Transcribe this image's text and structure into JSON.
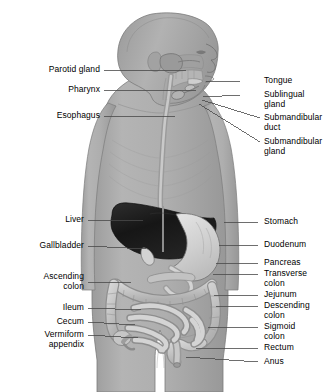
{
  "figure": {
    "background_color": "#ffffff",
    "body_fill": "#a9a9a9",
    "body_outline": "#6f6f6f",
    "text_color": "#000000",
    "leader_color": "#4a4a4a"
  },
  "labels_left": [
    {
      "name": "parotid-gland",
      "text": "Parotid gland",
      "x": 22,
      "y": 65,
      "w": 78,
      "lx1": 104,
      "ly1": 70,
      "lx2": 186,
      "ly2": 70
    },
    {
      "name": "pharynx",
      "text": "Pharynx",
      "x": 42,
      "y": 85,
      "w": 58,
      "lx1": 104,
      "ly1": 90,
      "lx2": 196,
      "ly2": 90
    },
    {
      "name": "esophagus",
      "text": "Esophagus",
      "x": 30,
      "y": 111,
      "w": 70,
      "lx1": 104,
      "ly1": 116,
      "lx2": 175,
      "ly2": 116
    },
    {
      "name": "liver",
      "text": "Liver",
      "x": 44,
      "y": 215,
      "w": 40,
      "lx1": 88,
      "ly1": 220,
      "lx2": 143,
      "ly2": 220
    },
    {
      "name": "gallbladder",
      "text": "Gallbladder",
      "x": 12,
      "y": 241,
      "w": 72,
      "lx1": 88,
      "ly1": 246,
      "lx2": 146,
      "ly2": 249
    },
    {
      "name": "ascending-colon",
      "text": "Ascending\ncolon",
      "x": 18,
      "y": 272,
      "w": 66,
      "lx1": 88,
      "ly1": 282,
      "lx2": 131,
      "ly2": 282
    },
    {
      "name": "ileum",
      "text": "Ileum",
      "x": 42,
      "y": 303,
      "w": 42,
      "lx1": 88,
      "ly1": 308,
      "lx2": 141,
      "ly2": 310
    },
    {
      "name": "cecum",
      "text": "Cecum",
      "x": 38,
      "y": 317,
      "w": 46,
      "lx1": 88,
      "ly1": 322,
      "lx2": 135,
      "ly2": 325
    },
    {
      "name": "vermiform-appendix",
      "text": "Vermiform\nappendix",
      "x": 18,
      "y": 330,
      "w": 66,
      "lx1": 88,
      "ly1": 335,
      "lx2": 138,
      "ly2": 338
    }
  ],
  "labels_right": [
    {
      "name": "tongue",
      "text": "Tongue",
      "x": 264,
      "y": 76,
      "lx1": 240,
      "ly1": 81,
      "lx2": 206,
      "ly2": 81
    },
    {
      "name": "sublingual-gland",
      "text": "Sublingual\ngland",
      "x": 264,
      "y": 90,
      "lx1": 240,
      "ly1": 95,
      "lx2": 203,
      "ly2": 97
    },
    {
      "name": "submandibular-duct",
      "text": "Submandibular\nduct",
      "x": 264,
      "y": 113,
      "lx1": 260,
      "ly1": 118,
      "lx2": 202,
      "ly2": 100
    },
    {
      "name": "submandibular-gland",
      "text": "Submandibular\ngland",
      "x": 264,
      "y": 137,
      "lx1": 260,
      "ly1": 142,
      "lx2": 199,
      "ly2": 104
    },
    {
      "name": "stomach",
      "text": "Stomach",
      "x": 264,
      "y": 217,
      "lx1": 258,
      "ly1": 222,
      "lx2": 224,
      "ly2": 222
    },
    {
      "name": "duodenum",
      "text": "Duodenum",
      "x": 264,
      "y": 240,
      "lx1": 258,
      "ly1": 245,
      "lx2": 219,
      "ly2": 245
    },
    {
      "name": "pancreas",
      "text": "Pancreas",
      "x": 264,
      "y": 258,
      "lx1": 258,
      "ly1": 263,
      "lx2": 216,
      "ly2": 263
    },
    {
      "name": "transverse-colon",
      "text": "Transverse\ncolon",
      "x": 264,
      "y": 269,
      "lx1": 258,
      "ly1": 274,
      "lx2": 213,
      "ly2": 274
    },
    {
      "name": "jejunum",
      "text": "Jejunum",
      "x": 264,
      "y": 290,
      "lx1": 258,
      "ly1": 295,
      "lx2": 214,
      "ly2": 295
    },
    {
      "name": "descending-colon",
      "text": "Descending\ncolon",
      "x": 264,
      "y": 301,
      "lx1": 258,
      "ly1": 306,
      "lx2": 216,
      "ly2": 306
    },
    {
      "name": "sigmoid-colon",
      "text": "Sigmoid\ncolon",
      "x": 264,
      "y": 322,
      "lx1": 258,
      "ly1": 327,
      "lx2": 208,
      "ly2": 327
    },
    {
      "name": "rectum",
      "text": "Rectum",
      "x": 264,
      "y": 343,
      "lx1": 258,
      "ly1": 348,
      "lx2": 196,
      "ly2": 348
    },
    {
      "name": "anus",
      "text": "Anus",
      "x": 264,
      "y": 357,
      "lx1": 258,
      "ly1": 362,
      "lx2": 186,
      "ly2": 357
    }
  ],
  "organs": {
    "liver": {
      "label": "liver",
      "fill": "#1d1d1d"
    },
    "stomach": {
      "label": "stomach",
      "fill": "#d8d8d8"
    },
    "large_bowel": {
      "label": "large-intestine",
      "fill": "#c4c4c4"
    },
    "small_bowel": {
      "label": "small-intestine",
      "fill": "#cfcfcf"
    },
    "esophagus": {
      "label": "esophagus",
      "fill": "#bdbdbd"
    },
    "skull": {
      "label": "skull",
      "fill": "#9d9d9d"
    }
  }
}
